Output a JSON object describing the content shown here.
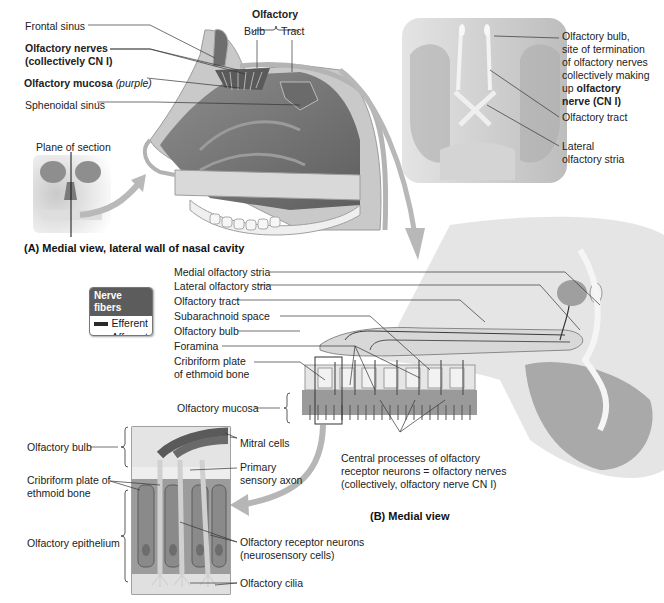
{
  "figure_a": {
    "caption": "(A) Medial view, lateral wall of nasal cavity",
    "labels": {
      "frontal_sinus": "Frontal sinus",
      "olfactory_nerves_line1": "Olfactory nerves",
      "olfactory_nerves_line2": "(collectively CN I)",
      "olfactory_mucosa": "Olfactory mucosa",
      "olfactory_mucosa_note": "(purple)",
      "sphenoidal_sinus": "Sphenoidal sinus",
      "plane_of_section": "Plane of section",
      "olfactory_heading": "Olfactory",
      "bulb": "Bulb",
      "tract": "Tract"
    }
  },
  "inferior_view": {
    "labels": {
      "bulb_line1": "Olfactory bulb,",
      "bulb_line2": "site of termination",
      "bulb_line3": "of olfactory nerves",
      "bulb_line4": "collectively making",
      "bulb_line5_prefix": "up ",
      "bulb_line5_bold": "olfactory",
      "bulb_line6_bold": "nerve (CN I)",
      "olfactory_tract": "Olfactory tract",
      "lateral_stria_line1": "Lateral",
      "lateral_stria_line2": "olfactory stria"
    }
  },
  "legend": {
    "title": "Nerve fibers",
    "items": [
      {
        "label": "Efferent",
        "color": "#2a2a2a"
      },
      {
        "label": "Afferent",
        "color": "#8a8a8a"
      }
    ]
  },
  "figure_b": {
    "caption": "(B) Medial view",
    "labels": {
      "medial_stria": "Medial olfactory stria",
      "lateral_stria": "Lateral olfactory stria",
      "olfactory_tract": "Olfactory tract",
      "subarachnoid": "Subarachnoid space",
      "olfactory_bulb": "Olfactory bulb",
      "foramina": "Foramina",
      "cribriform_line1": "Cribriform plate",
      "cribriform_line2": "of ethmoid bone",
      "olfactory_mucosa": "Olfactory mucosa",
      "central_line1": "Central processes of olfactory",
      "central_line2": "receptor neurons = olfactory nerves",
      "central_line3": "(collectively, olfactory nerve CN I)"
    }
  },
  "inset": {
    "labels": {
      "olfactory_bulb": "Olfactory bulb",
      "cribriform_line1": "Cribriform plate of",
      "cribriform_line2": "ethmoid bone",
      "olfactory_epithelium": "Olfactory epithelium",
      "mitral_cells": "Mitral cells",
      "primary_line1": "Primary",
      "primary_line2": "sensory axon",
      "receptor_line1": "Olfactory receptor neurons",
      "receptor_line2": "(neurosensory cells)",
      "cilia": "Olfactory cilia"
    }
  }
}
